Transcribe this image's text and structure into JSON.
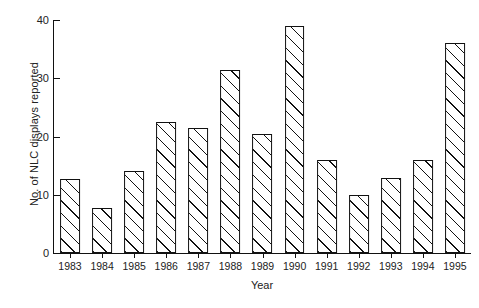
{
  "chart_data": {
    "type": "bar",
    "title": "",
    "subtitle": "",
    "xlabel": "Year",
    "ylabel": "No. of NLC displays reported",
    "categories": [
      "1983",
      "1984",
      "1985",
      "1986",
      "1987",
      "1988",
      "1989",
      "1990",
      "1991",
      "1992",
      "1993",
      "1994",
      "1995"
    ],
    "values": [
      12.7,
      7.7,
      14,
      22.5,
      21.4,
      31.5,
      20.4,
      39,
      16,
      10,
      12.8,
      16,
      36
    ],
    "series": [
      {
        "name": "NLC displays reported",
        "values": [
          12.7,
          7.7,
          14,
          22.5,
          21.4,
          31.5,
          20.4,
          39,
          16,
          10,
          12.8,
          16,
          36
        ]
      }
    ],
    "ylim": [
      0,
      40
    ],
    "yticks": [
      0,
      10,
      20,
      30,
      40
    ],
    "ytick_labels": [
      "0",
      "10",
      "20",
      "30",
      "40"
    ],
    "grid": false,
    "legend": false,
    "legend_position": "none",
    "bar_style": {
      "fill": "#ffffff",
      "edge_color": "#111111",
      "hatch": "diagonal-45",
      "hatch_color": "#111111"
    },
    "axis_color": "#111111",
    "annotations": []
  }
}
